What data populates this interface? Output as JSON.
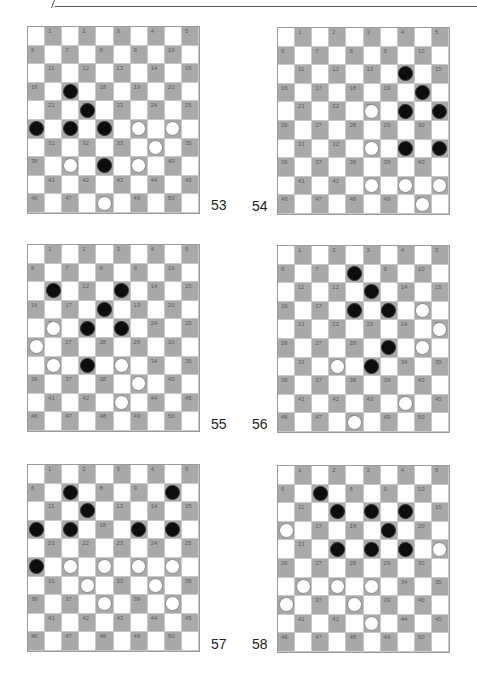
{
  "page": {
    "header": {
      "text": ""
    },
    "colors": {
      "dark_square": "#a9a9a9",
      "light_square": "#ffffff",
      "black_piece": "#0d0d0d",
      "white_piece": "#ffffff"
    }
  },
  "diagrams": [
    {
      "label": "53",
      "black": [
        17,
        22,
        26,
        27,
        28,
        38
      ],
      "white": [
        29,
        30,
        34,
        37,
        39,
        48
      ]
    },
    {
      "label": "54",
      "black": [
        14,
        20,
        24,
        25,
        34,
        35
      ],
      "white": [
        23,
        33,
        43,
        44,
        45,
        50
      ]
    },
    {
      "label": "55",
      "black": [
        11,
        13,
        18,
        22,
        23,
        32
      ],
      "white": [
        21,
        26,
        31,
        33,
        39,
        43
      ]
    },
    {
      "label": "56",
      "black": [
        8,
        13,
        18,
        19,
        29,
        33
      ],
      "white": [
        20,
        25,
        30,
        32,
        44,
        48
      ]
    },
    {
      "label": "57",
      "black": [
        7,
        10,
        12,
        16,
        17,
        19,
        20,
        26
      ],
      "white": [
        27,
        28,
        29,
        30,
        32,
        34,
        38,
        40
      ]
    },
    {
      "label": "58",
      "black": [
        7,
        12,
        13,
        14,
        19,
        22,
        23,
        24
      ],
      "white": [
        16,
        25,
        31,
        32,
        33,
        36,
        38,
        43
      ]
    }
  ]
}
